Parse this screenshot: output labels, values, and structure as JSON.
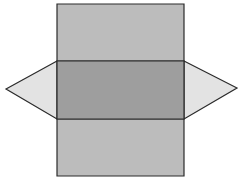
{
  "diagram": {
    "type": "triangular-prism-net",
    "stroke_color": "#2b2b2b",
    "faces": {
      "top_rectangle": {
        "fill": "#bcbcbc",
        "points": "57,4 184,4 184,61 57,61"
      },
      "middle_rectangle": {
        "fill": "#9e9e9e",
        "points": "57,61 184,61 184,119 57,119"
      },
      "bottom_rectangle": {
        "fill": "#bcbcbc",
        "points": "57,119 184,119 184,176 57,176"
      },
      "left_triangle": {
        "fill": "#e3e3e3",
        "points": "57,61 6,89 57,119"
      },
      "right_triangle": {
        "fill": "#e3e3e3",
        "points": "184,61 237,88 184,119"
      }
    }
  }
}
